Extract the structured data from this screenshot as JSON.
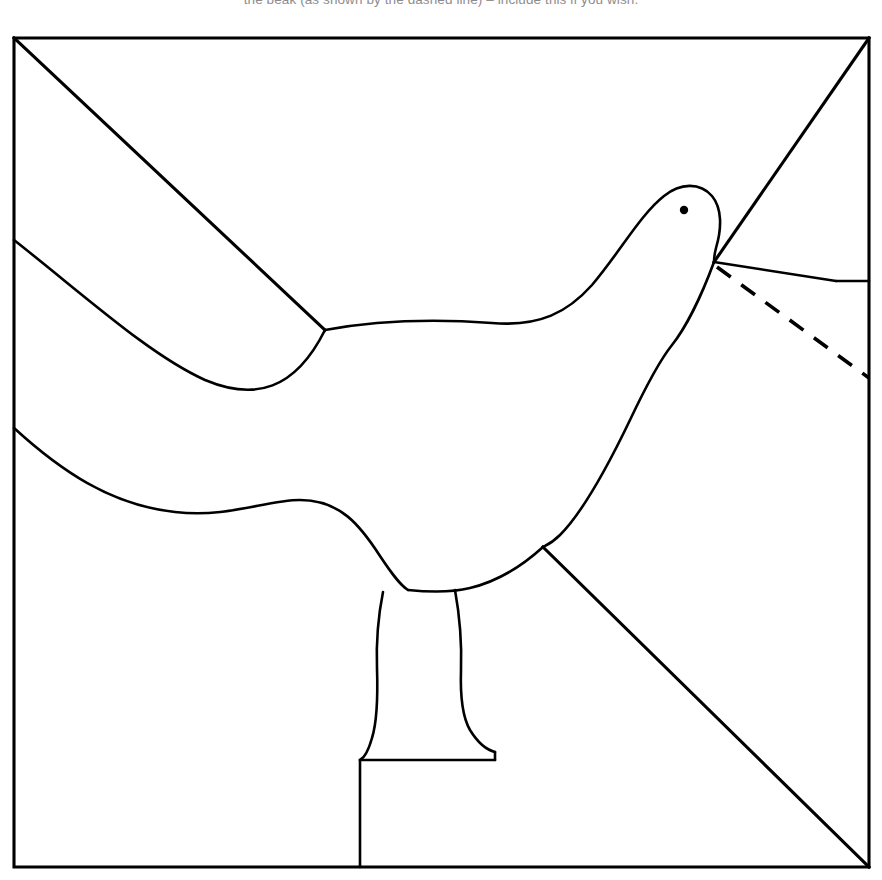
{
  "caption": {
    "text": "the beak (as shown by the dashed line) – include this if you wish.",
    "color": "#8c8c90"
  },
  "figure": {
    "stroke_color": "#000000",
    "background_color": "#ffffff",
    "frame": {
      "left": 14,
      "top": 38,
      "right": 869,
      "bottom": 867,
      "stroke_width": 3.1
    },
    "parts": {
      "frame_rect": "M14,38 L869,38 L869,867 L14,867 Z",
      "frame_diagonal_top_left": "M14,38 L325,330",
      "frame_diagonal_top_right": "M869,38 L714,262",
      "frame_diagonal_bottom_right": "M543,547 L869,867",
      "wing_upper": "M14,240 C90,300 150,355 205,380 C255,401 295,390 325,330",
      "back_and_head": "M325,330 C390,318 450,320 492,323 C540,327 568,312 592,285 C620,252 640,215 664,196 C680,183 700,182 712,196 C722,208 722,228 716,248 C714,256 714,259 714,262",
      "tail_lower": "M14,428 C60,470 110,505 175,512 C230,518 265,500 300,500 C340,500 360,525 380,556 C392,574 400,585 408,590",
      "breast": "M714,262 C700,300 684,330 672,345 C660,360 648,382 630,420 C606,470 580,515 560,535 C552,543 547,545 543,547",
      "belly_to_leg_right": "M543,547 C520,568 495,582 470,588 C450,593 428,592 408,590",
      "leg_left_outline": "M383,592 C379,612 376,640 377,668 C378,700 377,722 372,738 C368,752 364,758 360,760",
      "leg_right_outline": "M455,590 C459,612 462,640 461,670 C460,700 463,718 470,730 C478,743 487,750 495,752",
      "leg_base_top_right": "M495,752 L495,760",
      "leg_base_bottom": "M360,760 L495,760",
      "post": "M360,760 L360,867",
      "beak_upper": "M714,262 L836,281",
      "beak_lower_diagonal": "M836,281 L869,281",
      "beak_dashed": "M717,267 L869,378",
      "eye": {
        "cx": 684,
        "cy": 210,
        "r": 4.2
      }
    }
  }
}
